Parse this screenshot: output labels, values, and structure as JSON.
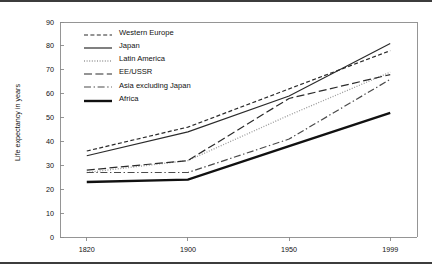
{
  "figure": {
    "background": "#ffffff",
    "rule_color": "#3c3c3c",
    "axis_color": "#8a8a8a",
    "ylabel": "Life expectancy in years"
  },
  "chart_data": {
    "type": "line",
    "title": "",
    "xlabel": "",
    "ylabel": "Life expectancy in years",
    "categories": [
      "1820",
      "1900",
      "1950",
      "1999"
    ],
    "x_tick_labels": [
      "1820",
      "1900",
      "1950",
      "1999"
    ],
    "y_tick_labels": [
      "0",
      "10",
      "20",
      "30",
      "40",
      "50",
      "60",
      "70",
      "80",
      "90"
    ],
    "y_ticks": [
      0,
      10,
      20,
      30,
      40,
      50,
      60,
      70,
      80,
      90
    ],
    "ylim": [
      0,
      90
    ],
    "grid": false,
    "legend_position": "upper-left-inside",
    "series": [
      {
        "name": "Western Europe",
        "values": [
          36,
          46,
          62,
          78
        ],
        "line_style": "dashed",
        "color": "#2b2b2b",
        "width": 1.2,
        "dash": "4,2.4"
      },
      {
        "name": "Japan",
        "values": [
          34,
          44,
          59,
          81
        ],
        "line_style": "solid",
        "color": "#2b2b2b",
        "width": 1.2,
        "dash": "none"
      },
      {
        "name": "Latin America",
        "values": [
          27,
          32,
          51,
          69
        ],
        "line_style": "dotted",
        "color": "#9a9a9a",
        "width": 1.3,
        "dash": "1,1.6"
      },
      {
        "name": "EE/USSR",
        "values": [
          28,
          32,
          58,
          68
        ],
        "line_style": "long-dash",
        "color": "#2b2b2b",
        "width": 1.2,
        "dash": "8,3.4"
      },
      {
        "name": "Asia excluding Japan",
        "values": [
          27,
          27,
          41,
          66
        ],
        "line_style": "dash-dot",
        "color": "#4a4a4a",
        "width": 1.2,
        "dash": "7,2.6,1.4,2.6"
      },
      {
        "name": "Africa",
        "values": [
          23,
          24,
          38,
          52
        ],
        "line_style": "solid-thick",
        "color": "#111111",
        "width": 2.4,
        "dash": "none"
      }
    ]
  },
  "legend": {
    "items": [
      {
        "label": "Western Europe"
      },
      {
        "label": "Japan"
      },
      {
        "label": "Latin America"
      },
      {
        "label": "EE/USSR"
      },
      {
        "label": "Asia excluding Japan"
      },
      {
        "label": "Africa"
      }
    ]
  }
}
